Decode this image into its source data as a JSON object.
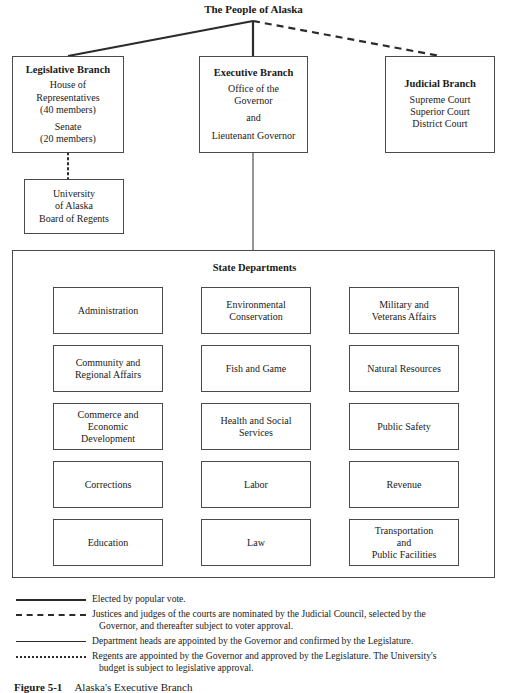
{
  "top": {
    "people_title": "The People of Alaska"
  },
  "branches": [
    {
      "id": "legislative",
      "title": "Legislative Branch",
      "lines": [
        "House of",
        "Representatives",
        "(40 members)",
        "",
        "Senate",
        "(20 members)"
      ]
    },
    {
      "id": "executive",
      "title": "Executive Branch",
      "lines": [
        "Office of the",
        "Governor",
        "",
        "and",
        "",
        "Lieutenant Governor"
      ]
    },
    {
      "id": "judicial",
      "title": "Judicial Branch",
      "lines": [
        "Supreme Court",
        "Superior Court",
        "District Court"
      ]
    }
  ],
  "university": {
    "lines": [
      "University",
      "of Alaska",
      "Board of Regents"
    ]
  },
  "state_departments": {
    "title": "State Departments",
    "columns": [
      [
        "Administration",
        "Community and\nRegional Affairs",
        "Commerce and\nEconomic\nDevelopment",
        "Corrections",
        "Education"
      ],
      [
        "Environmental\nConservation",
        "Fish and Game",
        "Health and Social\nServices",
        "Labor",
        "Law"
      ],
      [
        "Military and\nVeterans Affairs",
        "Natural Resources",
        "Public Safety",
        "Revenue",
        "Transportation\nand\nPublic Facilities"
      ]
    ],
    "items": [
      "Administration",
      "Environmental Conservation",
      "Military and Veterans Affairs",
      "Community and Regional Affairs",
      "Fish and Game",
      "Natural Resources",
      "Commerce and Economic Development",
      "Health and Social Services",
      "Public Safety",
      "Corrections",
      "Labor",
      "Revenue",
      "Education",
      "Law",
      "Transportation and Public Facilities"
    ]
  },
  "legend": [
    {
      "style": "solid-thick",
      "text": "Elected by popular vote.",
      "continuation": ""
    },
    {
      "style": "dashed",
      "text": "Justices and judges of the courts are nominated by the Judicial Council, selected by the",
      "continuation": "Governor, and thereafter subject to voter approval."
    },
    {
      "style": "solid-thin",
      "text": "Department heads are appointed by the Governor and confirmed by the Legislature.",
      "continuation": ""
    },
    {
      "style": "dotted",
      "text": "Regents are appointed by the Governor and approved by the Legislature. The University's",
      "continuation": "budget is subject to legislative approval."
    }
  ],
  "caption": {
    "label": "Figure 5-1",
    "text": "Alaska's Executive Branch"
  },
  "colors": {
    "line": "#2b2b2b",
    "border": "#4a4a4a",
    "text": "#1a1a1a",
    "background": "#ffffff"
  }
}
